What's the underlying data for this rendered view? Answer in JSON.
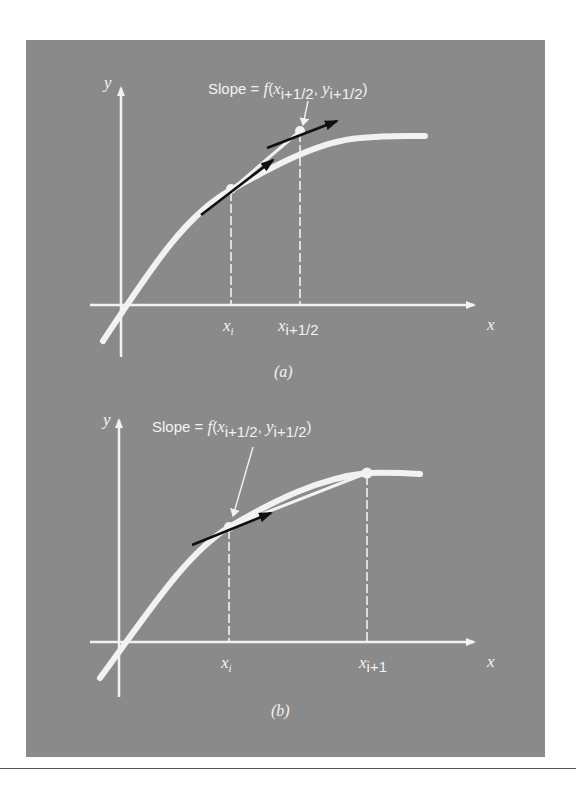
{
  "figure": {
    "background_color": "#8a8a8a",
    "curve_color": "#f2f2f2",
    "arrow_color": "#111111",
    "panels": [
      {
        "id": "a",
        "caption": "(a)",
        "slope_label": {
          "prefix": "Slope = ",
          "func": "f",
          "open": "(",
          "x": "x",
          "x_sub": "i+1/2",
          "sep": ", ",
          "y": "y",
          "y_sub": "i+1/2",
          "close": ")"
        },
        "y_axis_label": "y",
        "x_axis_label": "x",
        "tick_labels": [
          {
            "main": "x",
            "sub": "i"
          },
          {
            "main": "x",
            "sub": "i+1/2"
          }
        ]
      },
      {
        "id": "b",
        "caption": "(b)",
        "slope_label": {
          "prefix": "Slope = ",
          "func": "f",
          "open": "(",
          "x": "x",
          "x_sub": "i+1/2",
          "sep": ", ",
          "y": "y",
          "y_sub": "i+1/2",
          "close": ")"
        },
        "y_axis_label": "y",
        "x_axis_label": "x",
        "tick_labels": [
          {
            "main": "x",
            "sub": "i"
          },
          {
            "main": "x",
            "sub": "i+1"
          }
        ]
      }
    ]
  }
}
